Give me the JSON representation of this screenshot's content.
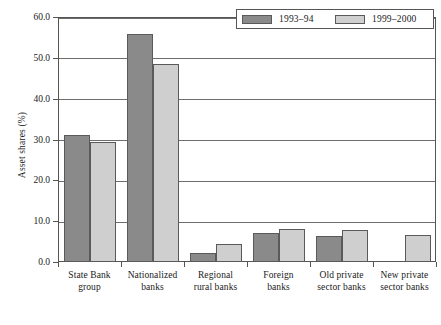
{
  "chart_data": {
    "type": "bar",
    "title": "",
    "subtitle": "",
    "xlabel": "",
    "ylabel": "Asset shares (%)",
    "ylim": [
      0,
      60
    ],
    "ytick_step": 10,
    "ytick_labels": [
      "0.0",
      "10.0",
      "20.0",
      "30.0",
      "40.0",
      "50.0",
      "60.0"
    ],
    "ytick_values": [
      0,
      10,
      20,
      30,
      40,
      50,
      60
    ],
    "grid": true,
    "grid_axis": "y",
    "legend_position": "top-right",
    "categories": [
      "State Bank group",
      "Nationalized banks",
      "Regional rural banks",
      "Foreign banks",
      "Old private sector banks",
      "New private sector banks"
    ],
    "category_lines": [
      [
        "State Bank",
        "group"
      ],
      [
        "Nationalized",
        "banks"
      ],
      [
        "Regional",
        "rural banks"
      ],
      [
        "Foreign",
        "banks"
      ],
      [
        "Old private",
        "sector banks"
      ],
      [
        "New private",
        "sector banks"
      ]
    ],
    "series": [
      {
        "name": "1993–94",
        "color": "#8a8a8a",
        "values": [
          31.2,
          55.8,
          2.2,
          7.0,
          6.3,
          0.0
        ]
      },
      {
        "name": "1999–2000",
        "color": "#cfcfcf",
        "values": [
          29.5,
          48.6,
          4.4,
          8.2,
          7.9,
          6.5
        ]
      }
    ]
  },
  "legend": {
    "items": [
      {
        "label": "1993–94",
        "color": "#8a8a8a"
      },
      {
        "label": "1999–2000",
        "color": "#cfcfcf"
      }
    ]
  },
  "axes": {
    "y_title": "Asset shares (%)"
  },
  "colors": {
    "series_1993_94": "#8a8a8a",
    "series_1999_2000": "#cfcfcf",
    "axis": "#555555",
    "gridline": "#6d6d6d",
    "background": "#ffffff"
  }
}
